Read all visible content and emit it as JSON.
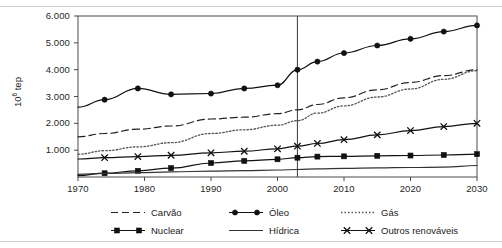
{
  "chart_data": {
    "type": "line",
    "title": "",
    "xlabel": "",
    "ylabel": "10⁶ tep",
    "ylabel_base": "10",
    "ylabel_exp": "6",
    "ylabel_unit": " tep",
    "xlim": [
      1970,
      2030
    ],
    "ylim": [
      0,
      6000
    ],
    "grid": false,
    "legend_position": "bottom",
    "xticks": [
      1970,
      1980,
      1990,
      2000,
      2010,
      2020,
      2030
    ],
    "xtick_labels": [
      "1970",
      "1980",
      "1990",
      "2000",
      "2010",
      "2020",
      "2030"
    ],
    "yticks": [
      1000,
      2000,
      3000,
      4000,
      5000,
      6000
    ],
    "ytick_labels": [
      "1.000",
      "2.000",
      "3.000",
      "4.000",
      "5.000",
      "6.000"
    ],
    "annotations": [
      {
        "name": "history-projection-divider",
        "type": "vline",
        "x": 2003
      }
    ],
    "x": [
      1970,
      1974,
      1979,
      1984,
      1990,
      1995,
      2000,
      2003,
      2006,
      2010,
      2015,
      2020,
      2025,
      2030
    ],
    "series": [
      {
        "name": "Carvão",
        "label": "Carvão",
        "style": "dashed",
        "marker": "none",
        "color": "#222222",
        "values": [
          1500,
          1620,
          1780,
          1900,
          2160,
          2230,
          2360,
          2500,
          2700,
          2950,
          3250,
          3520,
          3780,
          4000
        ]
      },
      {
        "name": "Óleo",
        "label": "Óleo",
        "style": "solid",
        "marker": "circle",
        "color": "#111111",
        "values": [
          2600,
          2880,
          3300,
          3080,
          3110,
          3300,
          3420,
          4000,
          4300,
          4620,
          4900,
          5150,
          5420,
          5650
        ]
      },
      {
        "name": "Gás",
        "label": "Gás",
        "style": "dotted",
        "marker": "none",
        "color": "#555555",
        "values": [
          850,
          980,
          1120,
          1280,
          1620,
          1760,
          1930,
          2100,
          2380,
          2650,
          2980,
          3280,
          3640,
          3960
        ]
      },
      {
        "name": "Nuclear",
        "label": "Nuclear",
        "style": "solid",
        "marker": "square",
        "color": "#111111",
        "values": [
          50,
          140,
          230,
          330,
          520,
          600,
          660,
          720,
          760,
          770,
          790,
          800,
          820,
          850
        ]
      },
      {
        "name": "Hídrica",
        "label": "Hídrica",
        "style": "solid",
        "marker": "none",
        "color": "#333333",
        "values": [
          100,
          130,
          160,
          190,
          220,
          240,
          260,
          280,
          300,
          320,
          340,
          355,
          370,
          430
        ]
      },
      {
        "name": "Outros renováveis",
        "label": "Outros renováveis",
        "style": "solid",
        "marker": "x",
        "color": "#111111",
        "values": [
          670,
          720,
          760,
          810,
          900,
          960,
          1050,
          1150,
          1250,
          1390,
          1570,
          1730,
          1880,
          2000
        ]
      }
    ]
  }
}
